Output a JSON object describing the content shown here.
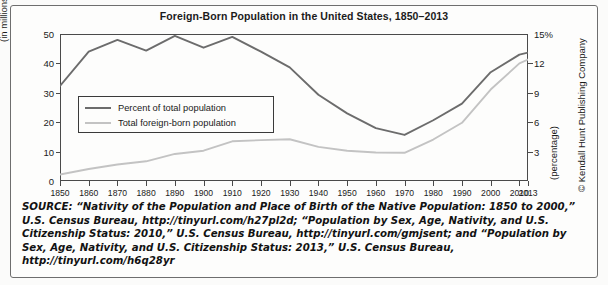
{
  "figure": {
    "title": "Foreign-Born Population in the United States, 1850–2013",
    "copyright": "© Kendall Hunt Publishing Company"
  },
  "axes": {
    "left_label": "(in millions)",
    "right_label": "(percentage)",
    "left_ticks": [
      "0",
      "10",
      "20",
      "30",
      "40",
      "50"
    ],
    "right_ticks": [
      "3",
      "6",
      "9",
      "12",
      "15%"
    ],
    "x_ticks": [
      "1850",
      "1860",
      "1870",
      "1880",
      "1890",
      "1900",
      "1910",
      "1920",
      "1930",
      "1940",
      "1950",
      "1960",
      "1970",
      "1980",
      "1990",
      "2000",
      "2010",
      "2013"
    ]
  },
  "legend": {
    "position": "inside-left",
    "items": [
      {
        "label": "Percent of total population",
        "color": "#6c6c6c"
      },
      {
        "label": "Total foreign-born population",
        "color": "#c3c3c3"
      }
    ]
  },
  "source": {
    "lead": "SOURCE:",
    "text": " “Nativity of the Population and Place of Birth of the Native Population: 1850 to 2000,” U.S. Census Bureau, http://tinyurl.com/h27pl2d; “Population by Sex, Age, Nativity, and U.S. Citizenship Status: 2010,” U.S. Census Bureau, http://tinyurl.com/gmjsent; and “Population by Sex, Age, Nativity, and U.S. Citizenship Status: 2013,” U.S. Census Bureau, http://tinyurl.com/h6q28yr"
  },
  "chart_data": {
    "type": "line",
    "title": "Foreign-Born Population in the United States, 1850–2013",
    "xlabel": "",
    "ylabel": "(in millions)",
    "y2label": "(percentage)",
    "ylim": [
      0,
      50
    ],
    "y2lim": [
      0,
      15
    ],
    "grid": false,
    "legend_position": "inside-left",
    "x": [
      1850,
      1860,
      1870,
      1880,
      1890,
      1900,
      1910,
      1920,
      1930,
      1940,
      1950,
      1960,
      1970,
      1980,
      1990,
      2000,
      2010,
      2013
    ],
    "series": [
      {
        "name": "Percent of total population",
        "axis": "right",
        "unit": "%",
        "color": "#6c6c6c",
        "values": [
          9.7,
          13.2,
          14.4,
          13.3,
          14.8,
          13.6,
          14.7,
          13.2,
          11.6,
          8.8,
          6.9,
          5.4,
          4.7,
          6.2,
          7.9,
          11.1,
          12.9,
          13.1
        ]
      },
      {
        "name": "Total foreign-born population",
        "axis": "left",
        "unit": "millions",
        "color": "#c3c3c3",
        "values": [
          2.2,
          4.1,
          5.6,
          6.7,
          9.2,
          10.3,
          13.5,
          13.9,
          14.2,
          11.6,
          10.3,
          9.7,
          9.6,
          14.1,
          19.8,
          31.1,
          40.0,
          41.3
        ]
      }
    ]
  }
}
